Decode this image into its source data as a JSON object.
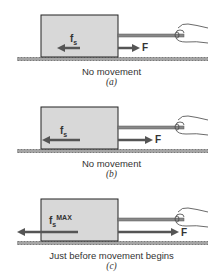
{
  "colors": {
    "block_fill": "#d8d8d8",
    "block_stroke": "#222222",
    "ground": "#9a9a9a",
    "rod": "#888888",
    "arrow": "#555555",
    "text": "#333333"
  },
  "panels": [
    {
      "id": "a",
      "caption": "No movement",
      "sublabel": "(a)",
      "friction_label": "f",
      "friction_sub": "s",
      "friction_sup": "",
      "force_label": "F",
      "friction_arrow_length": "short",
      "force_arrow_length": "short"
    },
    {
      "id": "b",
      "caption": "No movement",
      "sublabel": "(b)",
      "friction_label": "f",
      "friction_sub": "s",
      "friction_sup": "",
      "force_label": "F",
      "friction_arrow_length": "medium",
      "force_arrow_length": "medium"
    },
    {
      "id": "c",
      "caption": "Just before movement begins",
      "sublabel": "(c)",
      "friction_label": "f",
      "friction_sub": "s",
      "friction_sup": "MAX",
      "force_label": "F",
      "friction_arrow_length": "long",
      "force_arrow_length": "long"
    }
  ]
}
